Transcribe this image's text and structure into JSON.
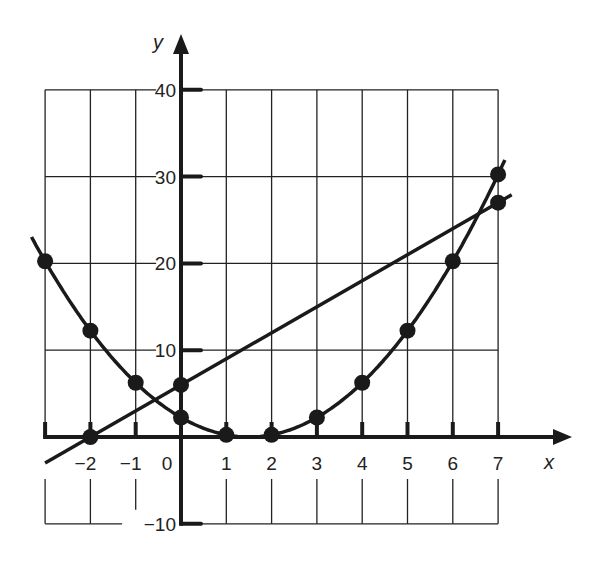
{
  "chart_data": {
    "type": "line",
    "title": "",
    "xlabel": "x",
    "ylabel": "y",
    "xlim": [
      -3,
      7
    ],
    "ylim": [
      -10,
      40
    ],
    "grid": true,
    "x_ticks": [
      "-2",
      "-1",
      "0",
      "1",
      "2",
      "3",
      "4",
      "5",
      "6",
      "7"
    ],
    "y_ticks": [
      "40",
      "30",
      "20",
      "10",
      "-10"
    ],
    "series": [
      {
        "name": "parabola",
        "equation": "y = (x - 1.5)^2",
        "x": [
          -3,
          -2,
          -1,
          0,
          1,
          2,
          3,
          4,
          5,
          6,
          7
        ],
        "y": [
          20,
          13,
          7,
          3,
          0.5,
          0.5,
          2.5,
          6.5,
          12.5,
          20,
          30.5
        ]
      },
      {
        "name": "line",
        "equation": "y = 3x + 6",
        "x": [
          -2,
          0,
          7
        ],
        "y": [
          0,
          6,
          27
        ]
      }
    ]
  },
  "labels": {
    "x_axis": "x",
    "y_axis": "y",
    "x_ticks": [
      "−2",
      "−1",
      "0",
      "1",
      "2",
      "3",
      "4",
      "5",
      "6",
      "7"
    ],
    "y_ticks": [
      "40",
      "30",
      "20",
      "10",
      "−10"
    ]
  }
}
